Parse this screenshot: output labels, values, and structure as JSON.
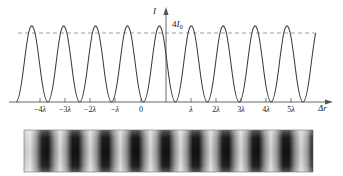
{
  "figure": {
    "title": "",
    "caption": ""
  },
  "axes": {
    "y_axis_label": "I",
    "x_axis_label": "Δr",
    "peak_label_text": "4I",
    "peak_label_sub": "0",
    "origin_label": "0"
  },
  "ticks": [
    {
      "label_sign": "−",
      "label_num": "4",
      "label_sym": "λ",
      "value": -4
    },
    {
      "label_sign": "−",
      "label_num": "3",
      "label_sym": "λ",
      "value": -3
    },
    {
      "label_sign": "−",
      "label_num": "2",
      "label_sym": "λ",
      "value": -2
    },
    {
      "label_sign": "−",
      "label_num": "",
      "label_sym": "λ",
      "value": -1
    },
    {
      "label_sign": "",
      "label_num": "0",
      "label_sym": "",
      "value": 0
    },
    {
      "label_sign": "",
      "label_num": "",
      "label_sym": "λ",
      "value": 1
    },
    {
      "label_sign": "",
      "label_num": "2",
      "label_sym": "λ",
      "value": 2
    },
    {
      "label_sign": "",
      "label_num": "3",
      "label_sym": "λ",
      "value": 3
    },
    {
      "label_sign": "",
      "label_num": "4",
      "label_sym": "λ",
      "value": 4
    },
    {
      "label_sign": "",
      "label_num": "5",
      "label_sym": "λ",
      "value": 5
    }
  ],
  "colors": {
    "curve": "#3a3a3a",
    "axis": "#555555",
    "dashed": "#8a8a8a",
    "fringe_dark": "#111111",
    "fringe_bright": "#d8d8d8"
  },
  "chart_data": {
    "type": "line",
    "title": "",
    "xlabel": "Δr",
    "ylabel": "I",
    "xlim": [
      -5.6,
      6.2
    ],
    "ylim": [
      0,
      1
    ],
    "grid": false,
    "legend": "none",
    "annotations": [
      {
        "text": "4I0",
        "x": 0.45,
        "y": 1.0,
        "note": "maximum intensity level, dashed reference line"
      }
    ],
    "xticks": [
      -4,
      -3,
      -2,
      -1,
      0,
      1,
      2,
      3,
      4,
      5
    ],
    "xticklabels": [
      "−4λ",
      "−3λ",
      "−2λ",
      "−λ",
      "0",
      "λ",
      "2λ",
      "3λ",
      "4λ",
      "5λ"
    ],
    "yticks": [
      0,
      1
    ],
    "yticklabels": [
      "",
      "4I0"
    ],
    "series": [
      {
        "name": "I(Δr) = 4I0 cos^2(π Δr / λ)",
        "formula": "4I0*cos(pi*x)^2",
        "peaks_at": [
          -5,
          -4,
          -3,
          -2,
          -1,
          0,
          1,
          2,
          3,
          4,
          5,
          6
        ],
        "minima_at": [
          -5.5,
          -4.5,
          -3.5,
          -2.5,
          -1.5,
          -0.5,
          0.5,
          1.5,
          2.5,
          3.5,
          4.5,
          5.5
        ],
        "peak_value": 1.0,
        "min_value": 0.0
      }
    ],
    "fringe_pattern": {
      "type": "heatmap",
      "description": "interference fringe photograph strip: bright bands at integer multiples of λ, dark bands at half-integer multiples",
      "bright_band_positions": [
        -5,
        -4,
        -3,
        -2,
        -1,
        0,
        1,
        2,
        3,
        4,
        5,
        6
      ],
      "dark_band_positions": [
        -5.5,
        -4.5,
        -3.5,
        -2.5,
        -1.5,
        -0.5,
        0.5,
        1.5,
        2.5,
        3.5,
        4.5,
        5.5
      ],
      "band_count": 12
    }
  }
}
